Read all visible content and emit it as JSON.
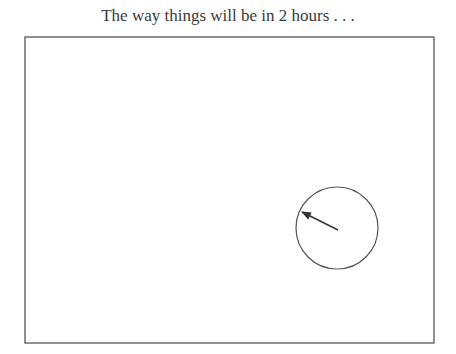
{
  "title": "The way things will be in 2 hours . . .",
  "diagram": {
    "frame": {
      "x": 25,
      "y": 37,
      "width": 409,
      "height": 306,
      "stroke": "#555555"
    },
    "circle": {
      "cx": 337,
      "cy": 228,
      "r": 41,
      "stroke": "#555555"
    },
    "arrow": {
      "x1": 338,
      "y1": 230,
      "x2": 302,
      "y2": 212,
      "stroke": "#333333"
    }
  }
}
